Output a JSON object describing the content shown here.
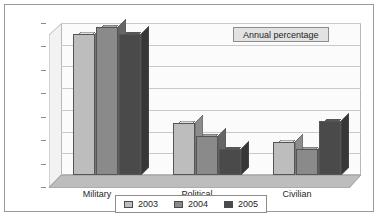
{
  "chart_data": {
    "type": "bar",
    "title": "",
    "annotation": "Annual percentage",
    "xlabel": "",
    "ylabel": "",
    "ylim": [
      0,
      70
    ],
    "ytick_step": 10,
    "yticks": [
      "70",
      "60",
      "50",
      "40",
      "30",
      "20",
      "10",
      "0"
    ],
    "grid": true,
    "legend_position": "bottom",
    "three_d": true,
    "categories": [
      "Military",
      "Political",
      "Civilian"
    ],
    "series": [
      {
        "name": "2003",
        "color": "#bdbdbd",
        "values": [
          65,
          24,
          15
        ]
      },
      {
        "name": "2004",
        "color": "#8a8a8a",
        "values": [
          68,
          18,
          12
        ]
      },
      {
        "name": "2005",
        "color": "#4a4a4a",
        "values": [
          65,
          12,
          25
        ]
      }
    ]
  },
  "colors": {
    "series_2003": "#bdbdbd",
    "series_2004": "#8a8a8a",
    "series_2005": "#4a4a4a",
    "frame": "#9a9a9a",
    "gridline": "#c9c9c9",
    "annotation_bg": "#e2e2e2",
    "background": "#ffffff"
  }
}
